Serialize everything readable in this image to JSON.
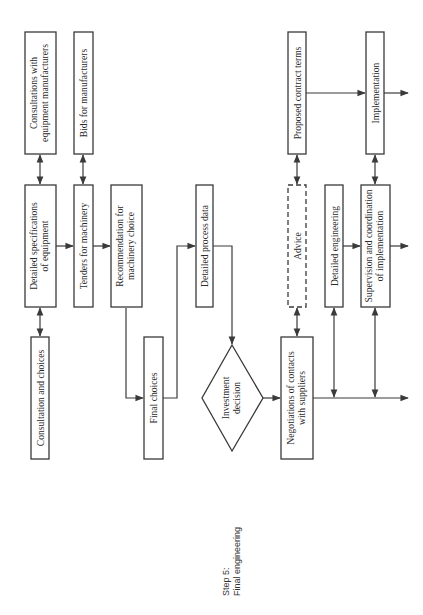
{
  "step": {
    "line1": "Step 5:",
    "line2": "Final engineering"
  },
  "boxes": {
    "consultations_manufacturers": {
      "line1": "Consultations with",
      "line2": "equipment manufacturers"
    },
    "bids": {
      "line1": "Bids for manufacturers"
    },
    "detailed_specs": {
      "line1": "Detailed specifications",
      "line2": "of equipment"
    },
    "tenders": {
      "line1": "Tenders for machinery"
    },
    "recommendation": {
      "line1": "Recommendation for",
      "line2": "machinery choice"
    },
    "consultation_choices": {
      "line1": "Consultation and choices"
    },
    "final_choices": {
      "line1": "Final choices"
    },
    "process_data": {
      "line1": "Detailed process data"
    },
    "investment": {
      "line1": "Investment",
      "line2": "decision"
    },
    "negotiations": {
      "line1": "Negotiations of contacts",
      "line2": "with suppliers"
    },
    "advice": {
      "line1": "Advice"
    },
    "detailed_engineering": {
      "line1": "Detailed engineering"
    },
    "supervision": {
      "line1": "Supervision and coordination",
      "line2": "of implementation"
    },
    "proposed_terms": {
      "line1": "Proposed contract terms"
    },
    "implementation": {
      "line1": "Implementation"
    }
  },
  "colors": {
    "stroke": "#3a3a3a",
    "text": "#2a2a2a",
    "background": "#ffffff"
  }
}
